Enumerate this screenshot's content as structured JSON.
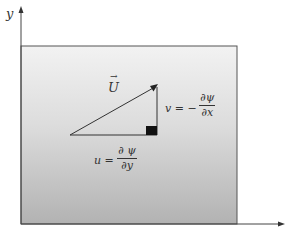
{
  "diagram": {
    "axes": {
      "y_label": "y",
      "x_label": ""
    },
    "region": {
      "fill_top": "#f2f2f2",
      "fill_bottom": "#b4b4b4",
      "border": "#555555"
    },
    "vector": {
      "label": "U",
      "arrow_accent": "→"
    },
    "v_component": {
      "lhs": "v = −",
      "numerator": "∂ψ",
      "denominator": "∂x"
    },
    "u_component": {
      "lhs": "u =",
      "numerator": "∂ ψ",
      "denominator": "∂y"
    },
    "right_angle_marker_color": "#111111"
  }
}
